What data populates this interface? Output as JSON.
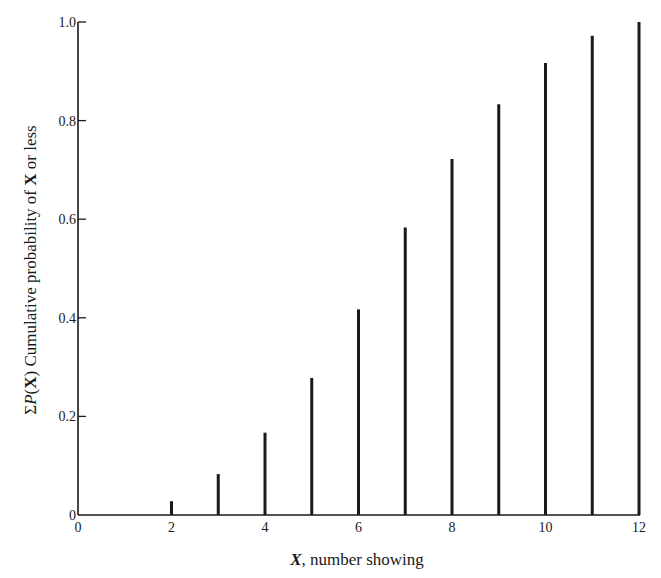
{
  "chart_data": {
    "type": "bar",
    "title": "",
    "xlabel": "X, number showing",
    "ylabel": "ΣP(X) Cumulative probability of X or less",
    "x": [
      2,
      3,
      4,
      5,
      6,
      7,
      8,
      9,
      10,
      11,
      12
    ],
    "values": [
      0.028,
      0.083,
      0.167,
      0.278,
      0.417,
      0.583,
      0.722,
      0.833,
      0.917,
      0.972,
      1.0
    ],
    "xlim": [
      0,
      12
    ],
    "ylim": [
      0,
      1.0
    ],
    "xticks": [
      "0",
      "2",
      "4",
      "6",
      "8",
      "10",
      "12"
    ],
    "yticks": [
      "0",
      "0.2",
      "0.4",
      "0.6",
      "0.8",
      "1.0"
    ],
    "grid": false,
    "legend": null,
    "bar_style": "thin vertical lines (spikes)"
  },
  "axes": {
    "xlabel_prefix": "X",
    "xlabel_rest": ", number showing",
    "ylabel_sum": "Σ",
    "ylabel_p": "P",
    "ylabel_x": "X",
    "ylabel_rest": " Cumulative probability of ",
    "ylabel_x2": "X",
    "ylabel_tail": " or less"
  },
  "colors": {
    "ink": "#1a1a1a",
    "background": "#ffffff"
  }
}
